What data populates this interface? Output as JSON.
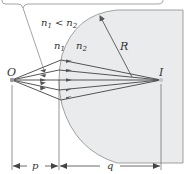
{
  "labels": {
    "condition": "n₁ < n₂",
    "n1_symbol": "n",
    "n1_sub": "1",
    "n2_symbol": "n",
    "n2_sub": "2",
    "cond_n1": "n",
    "cond_lt": "<",
    "cond_n2": "n",
    "radius": "R",
    "object": "O",
    "image": "I",
    "object_distance": "p",
    "image_distance": "q"
  },
  "colors": {
    "glass_fill": "#e9ebec",
    "glass_stroke": "#8a8a8a",
    "ray": "#555555",
    "line": "#666666"
  }
}
